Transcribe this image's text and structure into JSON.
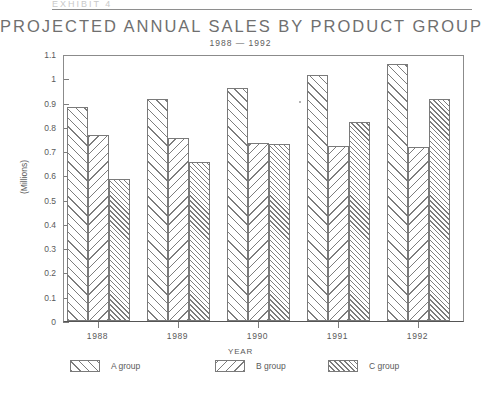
{
  "header": {
    "cut_off_text": "EXHIBIT 4",
    "title": "PROJECTED ANNUAL SALES BY PRODUCT GROUP",
    "subtitle": "1988 — 1992"
  },
  "chart_data": {
    "type": "bar",
    "title": "PROJECTED ANNUAL SALES BY PRODUCT GROUP",
    "subtitle": "1988 — 1992",
    "xlabel": "YEAR",
    "ylabel": "(Millions)",
    "categories": [
      "1988",
      "1989",
      "1990",
      "1991",
      "1992"
    ],
    "series": [
      {
        "name": "A group",
        "pattern": "diagonal-forward-sparse",
        "values": [
          0.88,
          0.915,
          0.96,
          1.015,
          1.06
        ]
      },
      {
        "name": "B group",
        "pattern": "diagonal-backward-sparse",
        "values": [
          0.765,
          0.755,
          0.735,
          0.72,
          0.715
        ]
      },
      {
        "name": "C group",
        "pattern": "diagonal-forward-dense",
        "values": [
          0.585,
          0.655,
          0.73,
          0.82,
          0.915
        ]
      }
    ],
    "ylim": [
      0,
      1.1
    ],
    "ytick_labels": [
      "1.1",
      "1",
      "0.9",
      "0.8",
      "0.7",
      "0.6",
      "0.5",
      "0.4",
      "0.3",
      "0.2",
      "0.1",
      "0"
    ],
    "ytick_values": [
      1.1,
      1.0,
      0.9,
      0.8,
      0.7,
      0.6,
      0.5,
      0.4,
      0.3,
      0.2,
      0.1,
      0
    ],
    "grid": false,
    "legend_position": "bottom",
    "legend": [
      "A group",
      "B group",
      "C group"
    ]
  },
  "colors": {
    "ink": "#7a7a7a",
    "text": "#5a5a5a",
    "title": "#6f6f6f",
    "background": "#ffffff"
  }
}
